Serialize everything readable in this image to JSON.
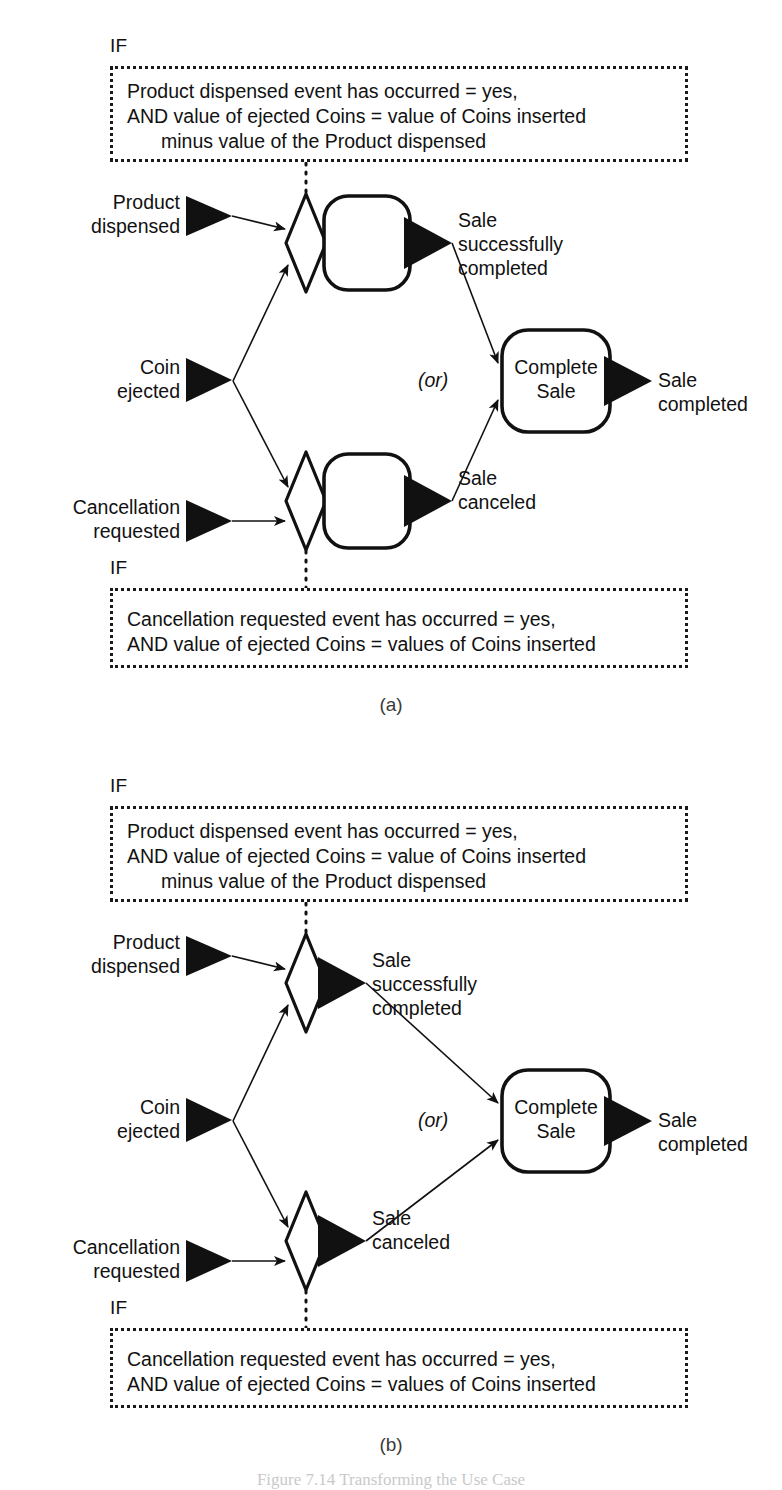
{
  "figure": {
    "caption": "Figure 7.14   Transforming the Use Case",
    "panels": [
      {
        "id": "a",
        "caption": "(a)",
        "top_condition": {
          "if_label": "IF",
          "lines": [
            "Product dispensed event has occurred = yes,",
            "AND value of ejected Coins = value of Coins inserted",
            "minus value of the Product dispensed"
          ]
        },
        "bottom_condition": {
          "if_label": "IF",
          "lines": [
            "Cancellation requested event has occurred = yes,",
            "AND value of ejected Coins = values of Coins inserted"
          ]
        },
        "inputs": [
          {
            "name": "product-dispensed",
            "lines": [
              "Product",
              "dispensed"
            ]
          },
          {
            "name": "coin-ejected",
            "lines": [
              "Coin",
              "ejected"
            ]
          },
          {
            "name": "cancellation-requested",
            "lines": [
              "Cancellation",
              "requested"
            ]
          }
        ],
        "outputs": [
          {
            "name": "sale-successfully-completed",
            "lines": [
              "Sale",
              "successfully",
              "completed"
            ]
          },
          {
            "name": "sale-canceled",
            "lines": [
              "Sale",
              "canceled"
            ]
          },
          {
            "name": "sale-completed",
            "lines": [
              "Sale",
              "completed"
            ]
          }
        ],
        "junction_label": "(or)",
        "process_nodes": [
          {
            "name": "upper-process",
            "text": ""
          },
          {
            "name": "lower-process",
            "text": ""
          },
          {
            "name": "complete-sale",
            "lines": [
              "Complete",
              "Sale"
            ]
          }
        ],
        "has_process_boxes_at_decisions": true
      },
      {
        "id": "b",
        "caption": "(b)",
        "top_condition": {
          "if_label": "IF",
          "lines": [
            "Product dispensed event has occurred = yes,",
            "AND value of ejected Coins = value of Coins inserted",
            "minus value of the Product dispensed"
          ]
        },
        "bottom_condition": {
          "if_label": "IF",
          "lines": [
            "Cancellation requested event has occurred = yes,",
            "AND value of ejected Coins = values of Coins inserted"
          ]
        },
        "inputs": [
          {
            "name": "product-dispensed",
            "lines": [
              "Product",
              "dispensed"
            ]
          },
          {
            "name": "coin-ejected",
            "lines": [
              "Coin",
              "ejected"
            ]
          },
          {
            "name": "cancellation-requested",
            "lines": [
              "Cancellation",
              "requested"
            ]
          }
        ],
        "outputs": [
          {
            "name": "sale-successfully-completed",
            "lines": [
              "Sale",
              "successfully",
              "completed"
            ]
          },
          {
            "name": "sale-canceled",
            "lines": [
              "Sale",
              "canceled"
            ]
          },
          {
            "name": "sale-completed",
            "lines": [
              "Sale",
              "completed"
            ]
          }
        ],
        "junction_label": "(or)",
        "process_nodes": [
          {
            "name": "complete-sale",
            "lines": [
              "Complete",
              "Sale"
            ]
          }
        ],
        "has_process_boxes_at_decisions": false
      }
    ]
  },
  "colors": {
    "ink": "#111111",
    "background": "#ffffff",
    "caption_gray": "#3b3b3b"
  },
  "text": {
    "a_top_l1": "Product dispensed event has occurred = yes,",
    "a_top_l2": "AND value of ejected Coins = value of Coins inserted",
    "a_top_l3": "minus value of the Product dispensed",
    "a_bot_l1": "Cancellation requested event has occurred = yes,",
    "a_bot_l2": "AND value of ejected Coins = values of Coins inserted",
    "b_top_l1": "Product dispensed event has occurred = yes,",
    "b_top_l2": "AND value of ejected Coins = value of Coins inserted",
    "b_top_l3": "minus value of the Product dispensed",
    "b_bot_l1": "Cancellation requested event has occurred = yes,",
    "b_bot_l2": "AND value of ejected Coins = values of Coins inserted",
    "if": "IF",
    "or": "(or)",
    "product": "Product",
    "dispensed": "dispensed",
    "coin": "Coin",
    "ejected": "ejected",
    "cancellation": "Cancellation",
    "requested": "requested",
    "sale": "Sale",
    "successfully": "successfully",
    "completed": "completed",
    "canceled": "canceled",
    "complete": "Complete",
    "sale_word": "Sale",
    "caption_a": "(a)",
    "caption_b": "(b)",
    "fig": "Figure 7.14   Transforming the Use Case"
  }
}
